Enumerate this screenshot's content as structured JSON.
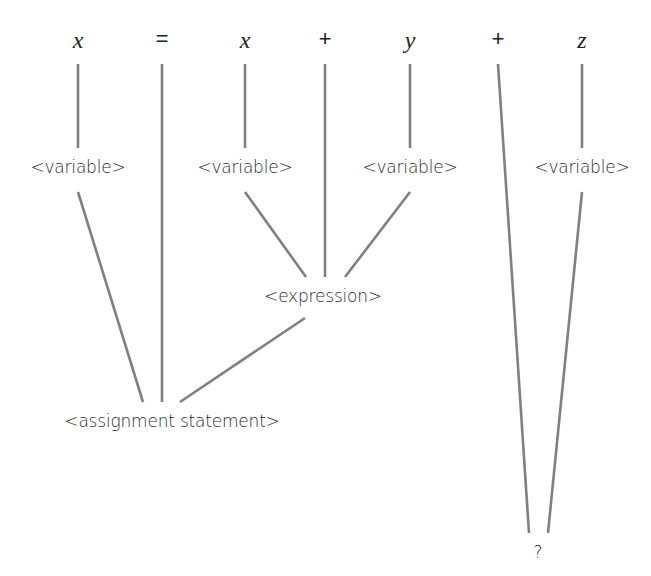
{
  "tokens": [
    {
      "id": "x1",
      "label": "x",
      "x": 78,
      "y": 40,
      "italic": true
    },
    {
      "id": "eq",
      "label": "=",
      "x": 162,
      "y": 40,
      "italic": false
    },
    {
      "id": "x2",
      "label": "x",
      "x": 245,
      "y": 40,
      "italic": true
    },
    {
      "id": "plus1",
      "label": "+",
      "x": 325,
      "y": 40,
      "italic": false
    },
    {
      "id": "y",
      "label": "y",
      "x": 410,
      "y": 40,
      "italic": true
    },
    {
      "id": "plus2",
      "label": "+",
      "x": 498,
      "y": 40,
      "italic": false
    },
    {
      "id": "z",
      "label": "z",
      "x": 582,
      "y": 40,
      "italic": true
    }
  ],
  "nodes": [
    {
      "id": "var1",
      "label": "<variable>",
      "x": 78,
      "y": 167
    },
    {
      "id": "var2",
      "label": "<variable>",
      "x": 245,
      "y": 167
    },
    {
      "id": "var3",
      "label": "<variable>",
      "x": 410,
      "y": 167
    },
    {
      "id": "var4",
      "label": "<variable>",
      "x": 582,
      "y": 167
    },
    {
      "id": "expr",
      "label": "<expression>",
      "x": 323,
      "y": 296
    },
    {
      "id": "assign",
      "label": "<assignment statement>",
      "x": 172,
      "y": 421
    },
    {
      "id": "unknown",
      "label": "?",
      "x": 538,
      "y": 552
    }
  ],
  "edges": [
    {
      "from": "x1",
      "to": "var1",
      "x1": 78,
      "y1": 64,
      "x2": 78,
      "y2": 148
    },
    {
      "from": "x2",
      "to": "var2",
      "x1": 245,
      "y1": 64,
      "x2": 245,
      "y2": 148
    },
    {
      "from": "y",
      "to": "var3",
      "x1": 410,
      "y1": 64,
      "x2": 410,
      "y2": 148
    },
    {
      "from": "z",
      "to": "var4",
      "x1": 582,
      "y1": 64,
      "x2": 582,
      "y2": 148
    },
    {
      "from": "var2",
      "to": "expr",
      "x1": 245,
      "y1": 192,
      "x2": 306,
      "y2": 277
    },
    {
      "from": "plus1",
      "to": "expr",
      "x1": 325,
      "y1": 64,
      "x2": 325,
      "y2": 277
    },
    {
      "from": "var3",
      "to": "expr",
      "x1": 410,
      "y1": 192,
      "x2": 345,
      "y2": 277
    },
    {
      "from": "var1",
      "to": "assign",
      "x1": 78,
      "y1": 192,
      "x2": 143,
      "y2": 402
    },
    {
      "from": "eq",
      "to": "assign",
      "x1": 162,
      "y1": 64,
      "x2": 162,
      "y2": 402
    },
    {
      "from": "expr",
      "to": "assign",
      "x1": 305,
      "y1": 318,
      "x2": 180,
      "y2": 402
    },
    {
      "from": "plus2",
      "to": "unknown",
      "x1": 498,
      "y1": 64,
      "x2": 529,
      "y2": 533
    },
    {
      "from": "var4",
      "to": "unknown",
      "x1": 582,
      "y1": 192,
      "x2": 548,
      "y2": 533
    }
  ],
  "colors": {
    "edge": "#808080",
    "text": "#222222",
    "background": "#ffffff"
  }
}
